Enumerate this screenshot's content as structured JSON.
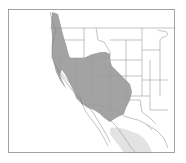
{
  "map": {
    "type": "range-map",
    "region": "Western North America",
    "colors": {
      "background": "#ffffff",
      "frame": "#8a8a8a",
      "border": "#9a9a9a",
      "range_primary": "#a3a3a3",
      "range_secondary": "#e3e3e3"
    },
    "layers": [
      {
        "name": "primary-range",
        "description": "Pacific Northwest coast through Great Basin, Rockies, Southwest"
      },
      {
        "name": "secondary-range",
        "description": "Northwestern Mexico light-shaded area"
      }
    ]
  }
}
